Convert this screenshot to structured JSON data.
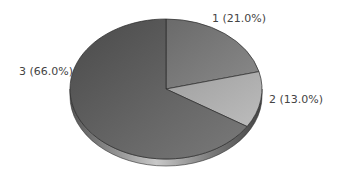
{
  "chart_data": {
    "type": "pie",
    "title": "",
    "categories": [
      "1",
      "2",
      "3"
    ],
    "values": [
      21.0,
      13.0,
      66.0
    ],
    "labels": [
      "1 (21.0%)",
      "2 (13.0%)",
      "3 (66.0%)"
    ],
    "colors": [
      "#7a7a7a",
      "#a8a8a8",
      "#5e5e5e"
    ],
    "style": "3d",
    "legend": false
  }
}
